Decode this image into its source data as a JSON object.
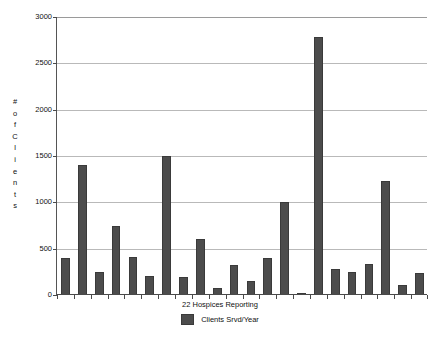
{
  "chart_data": {
    "type": "bar",
    "title": "",
    "xlabel": "22 Hospices Reporting",
    "ylabel": "# of Clients",
    "ylim": [
      0,
      3000
    ],
    "yticks": [
      0,
      500,
      1000,
      1500,
      2000,
      2500,
      3000
    ],
    "ytick_labels": [
      "0",
      "500",
      "1000",
      "1500",
      "2000",
      "2500",
      "3000"
    ],
    "grid": true,
    "legend_position": "bottom-center",
    "series": [
      {
        "name": "Clients Srvd/Year",
        "color": "#4c4c4c",
        "values": [
          400,
          1400,
          250,
          750,
          410,
          210,
          1500,
          190,
          600,
          80,
          320,
          150,
          400,
          1000,
          25,
          2780,
          280,
          250,
          340,
          1230,
          105,
          240
        ]
      }
    ],
    "categories": [
      "1",
      "2",
      "3",
      "4",
      "5",
      "6",
      "7",
      "8",
      "9",
      "10",
      "11",
      "12",
      "13",
      "14",
      "15",
      "16",
      "17",
      "18",
      "19",
      "20",
      "21",
      "22"
    ]
  },
  "axis": {
    "y_title_letters": [
      "#",
      "o",
      "f",
      "C",
      "l",
      "i",
      "e",
      "n",
      "t",
      "s"
    ],
    "x_title": "22 Hospices Reporting"
  },
  "legend": {
    "entries": [
      {
        "label": "Clients Srvd/Year",
        "color": "#4c4c4c"
      }
    ]
  }
}
